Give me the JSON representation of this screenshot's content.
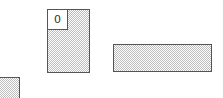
{
  "canvas": {
    "width": 223,
    "height": 98,
    "background": "#ffffff"
  },
  "style": {
    "border_color": "#555555",
    "hatch_color": "#bdbdbd"
  },
  "blocks": [
    {
      "id": "block-tall",
      "label": "0",
      "x": 47,
      "y": 9,
      "width": 43,
      "height": 64
    },
    {
      "id": "block-wide",
      "label": "",
      "x": 113,
      "y": 44,
      "width": 99,
      "height": 28
    },
    {
      "id": "block-partial",
      "label": "",
      "x": -2,
      "y": 77,
      "width": 22,
      "height": 24
    }
  ]
}
